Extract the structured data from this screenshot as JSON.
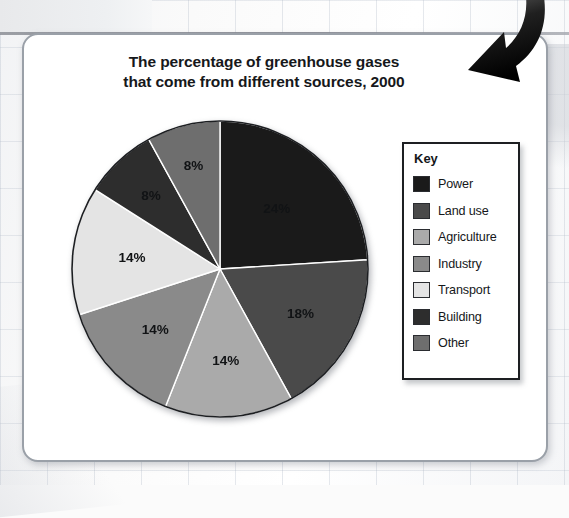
{
  "chart_title": {
    "line1": "The percentage of greenhouse gases",
    "line2": "that come from different sources, 2000"
  },
  "legend": {
    "title": "Key",
    "items": [
      {
        "label": "Power",
        "color": "#1a1a1a"
      },
      {
        "label": "Land use",
        "color": "#4a4a4a"
      },
      {
        "label": "Agriculture",
        "color": "#aaaaaa"
      },
      {
        "label": "Industry",
        "color": "#8a8a8a"
      },
      {
        "label": "Transport",
        "color": "#e4e4e4"
      },
      {
        "label": "Building",
        "color": "#2d2d2d"
      },
      {
        "label": "Other",
        "color": "#6e6e6e"
      }
    ]
  },
  "decorations": {
    "arrow": "curved-down-left-arrow-icon"
  },
  "chart_data": {
    "type": "pie",
    "title": "The percentage of greenhouse gases that come from different sources, 2000",
    "xlabel": "",
    "ylabel": "",
    "legend_position": "right",
    "grid": false,
    "start_angle_deg": 0,
    "direction": "clockwise",
    "unit": "%",
    "categories": [
      "Power",
      "Land use",
      "Agriculture",
      "Industry",
      "Transport",
      "Building",
      "Other"
    ],
    "values": [
      24,
      18,
      14,
      14,
      14,
      8,
      8
    ],
    "labels": [
      "24%",
      "18%",
      "14%",
      "14%",
      "14%",
      "8%",
      "8%"
    ],
    "colors": [
      "#1a1a1a",
      "#4a4a4a",
      "#aaaaaa",
      "#8a8a8a",
      "#e4e4e4",
      "#2d2d2d",
      "#6e6e6e"
    ],
    "total": 100
  }
}
